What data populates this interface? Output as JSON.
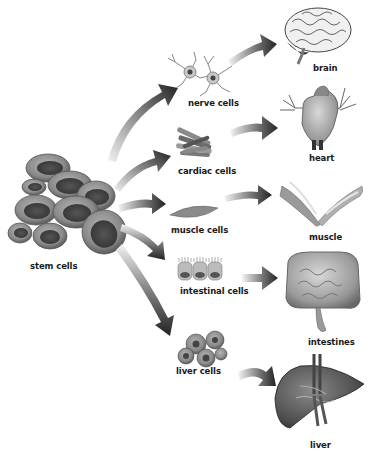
{
  "diagram": {
    "source": {
      "label": "stem cells",
      "icon": "stem-cells-cluster-icon"
    },
    "branches": [
      {
        "cell_label": "nerve cells",
        "cell_icon": "nerve-cells-icon",
        "organ_label": "brain",
        "organ_icon": "brain-icon"
      },
      {
        "cell_label": "cardiac cells",
        "cell_icon": "cardiac-cells-icon",
        "organ_label": "heart",
        "organ_icon": "heart-icon"
      },
      {
        "cell_label": "muscle cells",
        "cell_icon": "muscle-cells-icon",
        "organ_label": "muscle",
        "organ_icon": "muscle-icon"
      },
      {
        "cell_label": "intestinal cells",
        "cell_icon": "intestinal-cells-icon",
        "organ_label": "intestines",
        "organ_icon": "intestines-icon"
      },
      {
        "cell_label": "liver cells",
        "cell_icon": "liver-cells-icon",
        "organ_label": "liver",
        "organ_icon": "liver-icon"
      }
    ],
    "colors": {
      "background": "#ffffff",
      "arrow_dark": "#2a2a2a",
      "arrow_light": "#e6e6e6",
      "cell_fill": "#8a8a8a",
      "cell_dark": "#4a4a4a",
      "text": "#1a1a1a"
    }
  }
}
